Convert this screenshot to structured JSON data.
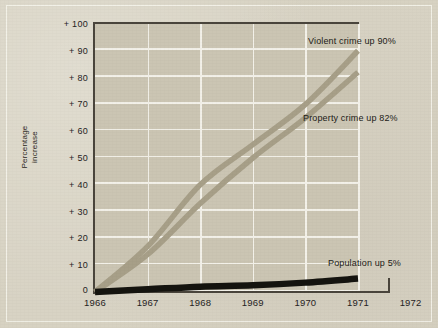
{
  "chart_data": {
    "type": "line",
    "title": "",
    "xlabel": "",
    "ylabel": "Percentage\nincrease",
    "ylabel_line1": "Percentage",
    "ylabel_line2": "increase",
    "x": [
      1966,
      1967,
      1968,
      1969,
      1970,
      1971
    ],
    "xlim": [
      1966,
      1972
    ],
    "ylim": [
      0,
      100
    ],
    "xticks": [
      "1966",
      "1967",
      "1968",
      "1969",
      "1970",
      "1971",
      "1972"
    ],
    "yticks": [
      "+ 100",
      "+ 90",
      "+ 80",
      "+ 70",
      "+ 60",
      "+ 50",
      "+ 40",
      "+ 30",
      "+ 20",
      "+ 10",
      "0"
    ],
    "ytick_values": [
      100,
      90,
      80,
      70,
      60,
      50,
      40,
      30,
      20,
      10,
      0
    ],
    "grid": "both",
    "legend": "inline-annotations",
    "series": [
      {
        "name": "Violent crime",
        "annotation": "Violent crime up 90%",
        "color": "#a79f88",
        "values": [
          0,
          17,
          40,
          55,
          70,
          90
        ]
      },
      {
        "name": "Property crime",
        "annotation": "Property crime up 82%",
        "color": "#a79f88",
        "values": [
          0,
          14,
          33,
          50,
          65,
          82
        ]
      },
      {
        "name": "Population",
        "annotation": "Population up 5%",
        "color": "#15140f",
        "values": [
          0,
          1,
          2,
          2.5,
          3.5,
          5
        ]
      }
    ]
  },
  "annotations": {
    "violent": "Violent crime up 90%",
    "property": "Property crime up 82%",
    "population": "Population up 5%"
  },
  "colors": {
    "paper": "#d7d2c2",
    "plot_background": "#cbc5b3",
    "gridline": "#f3f1e9",
    "axis": "#4a453c",
    "crime_line": "#a79f88",
    "population_line": "#15140f",
    "text": "#26231e"
  }
}
